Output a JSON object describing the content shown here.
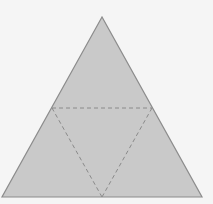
{
  "diagram": {
    "type": "tetrahedron-net",
    "colors": {
      "background": "#f5f5f5",
      "fill": "#c9c9c9",
      "outline": "#8c8c8c",
      "fold_line": "#8a8a8a"
    },
    "outer_triangle": {
      "apex": [
        102,
        17
      ],
      "bottom_left": [
        2,
        197
      ],
      "bottom_right": [
        202,
        197
      ]
    },
    "fold_lines": {
      "style": "dashed",
      "inner_triangle": {
        "left_mid": [
          52,
          108
        ],
        "right_mid": [
          152,
          108
        ],
        "bottom_mid": [
          102,
          197
        ]
      }
    }
  }
}
